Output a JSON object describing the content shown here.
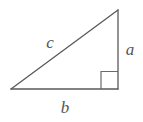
{
  "figure": {
    "name": "right-triangle",
    "background_color": "#ffffff",
    "stroke_color": "#595959",
    "label_color": "#555555",
    "stroke_width": 1.3
  },
  "labels": {
    "hypotenuse": "c",
    "vertical_leg": "a",
    "horizontal_leg": "b"
  },
  "geometry": {
    "vertex_left": {
      "x": 11,
      "y": 89
    },
    "vertex_right": {
      "x": 118,
      "y": 89
    },
    "vertex_top": {
      "x": 118,
      "y": 10
    },
    "right_angle_marker": {
      "x": 101,
      "y": 71,
      "size": 17
    },
    "label_positions": {
      "hypotenuse": {
        "x": 50,
        "y": 48
      },
      "vertical_leg": {
        "x": 125,
        "y": 55
      },
      "horizontal_leg": {
        "x": 59,
        "y": 113
      }
    }
  }
}
